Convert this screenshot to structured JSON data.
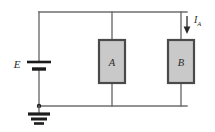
{
  "figure": {
    "name": "parallel-circuit-schematic",
    "type": "circuit-diagram",
    "background_color": "#ffffff"
  },
  "colors": {
    "wire": "#6e6e6e",
    "box_fill": "#c9c9c9",
    "box_border": "#4a4a4a",
    "ink": "#1c1c1c",
    "label": "#2a2a2a"
  },
  "labels": {
    "source": "E",
    "block_a": "A",
    "block_b": "B",
    "current_symbol": "I",
    "current_subscript": "A"
  },
  "components": {
    "source": {
      "name": "battery",
      "label": "E",
      "x": 39,
      "y_plate_long": 62,
      "y_plate_short": 69
    },
    "block_a": {
      "name": "block-a",
      "label": "A",
      "x": 99,
      "y": 40,
      "width": 26,
      "height": 43
    },
    "block_b": {
      "name": "block-b",
      "label": "B",
      "x": 168,
      "y": 40,
      "width": 26,
      "height": 43
    },
    "ground": {
      "name": "ground",
      "x": 39,
      "y": 106
    },
    "current_arrow": {
      "name": "current-arrow-ia",
      "label": "I",
      "subscript": "A",
      "x": 187,
      "y_start": 16,
      "y_end": 33,
      "direction": "down"
    }
  },
  "geometry": {
    "rail_top_y": 12,
    "rail_bottom_y": 106,
    "rail_left_x": 39,
    "rail_right_x": 187,
    "branch_a_x": 112,
    "branch_b_x": 181
  }
}
